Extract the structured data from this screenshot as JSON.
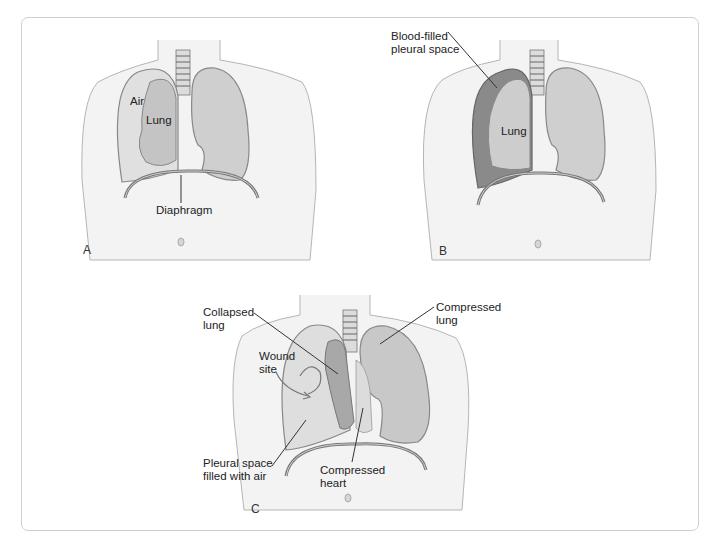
{
  "figure": {
    "panels": [
      {
        "id": "A",
        "letter": "A",
        "labels": {
          "air": "Air",
          "lung": "Lung",
          "diaphragm": "Diaphragm"
        }
      },
      {
        "id": "B",
        "letter": "B",
        "labels": {
          "blood_line1": "Blood-filled",
          "blood_line2": "pleural space",
          "lung": "Lung"
        }
      },
      {
        "id": "C",
        "letter": "C",
        "labels": {
          "collapsed_line1": "Collapsed",
          "collapsed_line2": "lung",
          "compressed_lung_line1": "Compressed",
          "compressed_lung_line2": "lung",
          "wound_line1": "Wound",
          "wound_line2": "site",
          "pleural_air_line1": "Pleural space",
          "pleural_air_line2": "filled with air",
          "compressed_heart_line1": "Compressed",
          "compressed_heart_line2": "heart"
        }
      }
    ],
    "colors": {
      "skin": "#f1f1f1",
      "outline": "#9a9a9a",
      "lung_fill": "#c9c9c9",
      "lung_dark": "#8f8f8f",
      "blood": "#7d7d7d",
      "frame": "#cfcfcf",
      "text": "#222222"
    }
  }
}
